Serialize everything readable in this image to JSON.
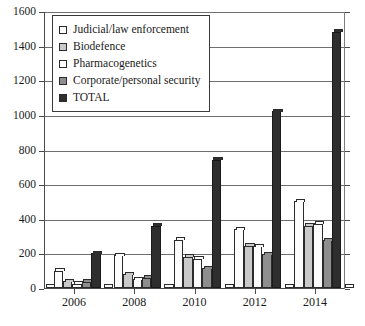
{
  "chart_data": {
    "type": "bar",
    "title": "",
    "xlabel": "",
    "ylabel": "",
    "ylim": [
      0,
      1600
    ],
    "ytick_values": [
      0,
      200,
      400,
      600,
      800,
      1000,
      1200,
      1400,
      1600
    ],
    "ytick_labels": [
      "0",
      "200",
      "400",
      "600",
      "800",
      "1000",
      "1200",
      "1400",
      "1600"
    ],
    "grid": true,
    "legend_position": "upper left",
    "categories": [
      "2006",
      "2008",
      "2010",
      "2012",
      "2014"
    ],
    "series": [
      {
        "name": "Judicial/law enforcement",
        "color": "#fdfdfd",
        "values": [
          100,
          190,
          280,
          340,
          500
        ]
      },
      {
        "name": "Biodefence",
        "color": "#c9c9c9",
        "values": [
          40,
          80,
          180,
          245,
          360
        ]
      },
      {
        "name": "Pharmacogenetics",
        "color": "#fdfdfd",
        "values": [
          25,
          50,
          170,
          240,
          370
        ]
      },
      {
        "name": "Corporate/personal security",
        "color": "#8e8e8e",
        "values": [
          35,
          60,
          115,
          195,
          275
        ]
      },
      {
        "name": "TOTAL",
        "color": "#2e2e2e",
        "values": [
          200,
          360,
          740,
          1020,
          1480
        ]
      }
    ]
  },
  "legend": {
    "items": [
      {
        "label": "Judicial/law enforcement",
        "swatch": "#fdfdfd"
      },
      {
        "label": "Biodefence",
        "swatch": "#c9c9c9"
      },
      {
        "label": "Pharmacogenetics",
        "swatch": "#fdfdfd"
      },
      {
        "label": "Corporate/personal security",
        "swatch": "#8e8e8e"
      },
      {
        "label": "TOTAL",
        "swatch": "#2e2e2e"
      }
    ]
  }
}
